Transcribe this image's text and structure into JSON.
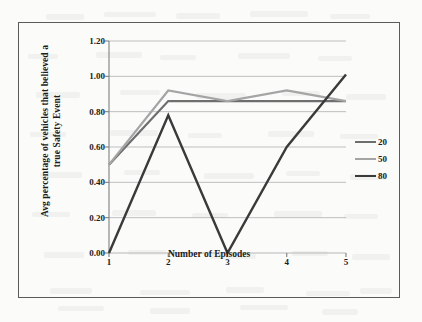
{
  "chart_data": {
    "type": "line",
    "title": "",
    "xlabel": "Number of Episodes",
    "ylabel": "Avg percentage of vehicles that believed a true Safety Event",
    "ylabel_line1": "Avg percentage of vehicles that believed a",
    "ylabel_line2": "true Safety Event",
    "categories": [
      "1",
      "2",
      "3",
      "4",
      "5"
    ],
    "x": [
      1,
      2,
      3,
      4,
      5
    ],
    "ylim": [
      0.0,
      1.2
    ],
    "xlim": [
      1,
      5
    ],
    "y_ticks": [
      "0.00",
      "0.20",
      "0.40",
      "0.60",
      "0.80",
      "1.00",
      "1.20"
    ],
    "y_tick_values": [
      0.0,
      0.2,
      0.4,
      0.6,
      0.8,
      1.0,
      1.2
    ],
    "grid": "horizontal",
    "legend_position": "right",
    "series": [
      {
        "name": "20",
        "color": "#6e6e6e",
        "width": 2.2,
        "values": [
          0.5,
          0.86,
          0.86,
          0.86,
          0.86
        ]
      },
      {
        "name": "50",
        "color": "#a5a5a5",
        "width": 2.2,
        "values": [
          0.5,
          0.92,
          0.86,
          0.92,
          0.86
        ]
      },
      {
        "name": "80",
        "color": "#3a3a3a",
        "width": 2.4,
        "values": [
          0.0,
          0.78,
          0.0,
          0.6,
          1.01
        ]
      }
    ]
  },
  "style": {
    "axis_color": "#808080",
    "grid_color": "#b8b8b8",
    "frame_color": "#5b5b5b",
    "text_color": "#1c1c1c",
    "page_background": "#fbfbfa"
  },
  "legend": {
    "items": [
      {
        "label": "20",
        "color": "#6e6e6e",
        "width": 2.2
      },
      {
        "label": "50",
        "color": "#a5a5a5",
        "width": 2.2
      },
      {
        "label": "80",
        "color": "#3a3a3a",
        "width": 2.4
      }
    ]
  }
}
